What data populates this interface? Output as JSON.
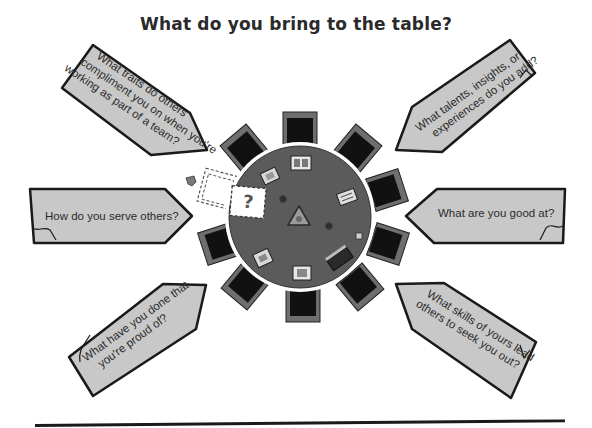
{
  "title": "What do you bring to the table?",
  "prompts": {
    "top_left": {
      "lines": [
        "What traits do others",
        "compliment you on when you're",
        "working as part of a team?"
      ]
    },
    "top_right": {
      "lines": [
        "What talents, insights, or",
        "experiences do you add?"
      ]
    },
    "mid_left": {
      "lines": [
        "How do you serve others?"
      ]
    },
    "mid_right": {
      "lines": [
        "What are you good at?"
      ]
    },
    "bottom_left": {
      "lines": [
        "What have you done that",
        "you're proud of?"
      ]
    },
    "bottom_right": {
      "lines": [
        "What skills of yours lead",
        "others to seek you out?"
      ]
    }
  },
  "table": {
    "chair_count": 10,
    "empty_seat_marker": "?",
    "colors": {
      "table": "#5b5b5b",
      "chair_seat": "#111111",
      "chair_frame": "#6e6e6e",
      "prompt_fill": "#c8c8c8",
      "prompt_stroke": "#1a1a1a"
    }
  }
}
